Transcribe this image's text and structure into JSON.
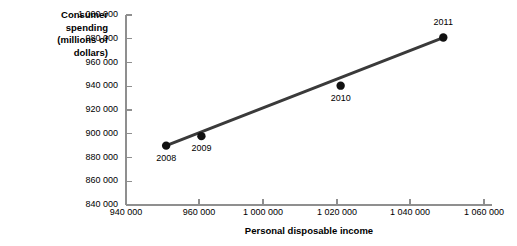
{
  "chart_data": {
    "type": "scatter",
    "title": "",
    "xlabel": "Personal disposable income",
    "ylabel": "Consumer spending (millions of dollars)",
    "ylabel_lines": [
      "Consumer",
      "spending",
      "(millions of",
      "dollars)"
    ],
    "xlim": [
      940000,
      1060000
    ],
    "ylim": [
      840000,
      1000000
    ],
    "grid": false,
    "legend": "none",
    "line_color": "#3a3a3a",
    "point_color": "#111111",
    "axis_color": "#8f8f8f",
    "x_ticks": [
      940000,
      960000,
      1000000,
      1020000,
      1040000,
      1060000
    ],
    "x_tick_labels": [
      "940 000",
      "960 000",
      "1 000 000",
      "1 020 000",
      "1 040 000",
      "1 060 000"
    ],
    "y_ticks": [
      840000,
      860000,
      880000,
      900000,
      920000,
      940000,
      960000,
      980000,
      1000000
    ],
    "y_tick_labels": [
      "840 000",
      "860 000",
      "880 000",
      "900 000",
      "920 000",
      "940 000",
      "960 000",
      "980 000",
      "1 000 000"
    ],
    "points": [
      {
        "label": "2008",
        "x": 951000,
        "y": 890000
      },
      {
        "label": "2009",
        "x": 961500,
        "y": 898000
      },
      {
        "label": "2010",
        "x": 1021000,
        "y": 940500
      },
      {
        "label": "2011",
        "x": 1049000,
        "y": 981000
      }
    ],
    "trendline": {
      "from": {
        "x": 951000,
        "y": 890000
      },
      "to": {
        "x": 1049000,
        "y": 981000
      }
    }
  }
}
